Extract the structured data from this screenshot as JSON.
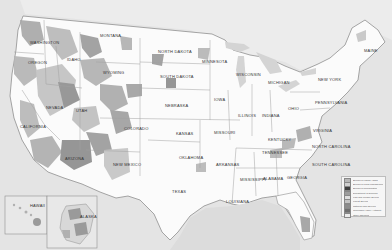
{
  "map": {
    "title": "Federal lands of the United States",
    "colors": {
      "ocean": "#e3e3e3",
      "land": "#fdfdfd",
      "federal_dark": "#8a8a8a",
      "federal_mid": "#a9a9a9",
      "federal_light": "#c9c9c9",
      "state_border": "#9a9a9a"
    },
    "state_labels": [
      {
        "name": "Washington",
        "x": 30,
        "y": 40
      },
      {
        "name": "Montana",
        "x": 100,
        "y": 33
      },
      {
        "name": "North Dakota",
        "x": 158,
        "y": 49
      },
      {
        "name": "Minnesota",
        "x": 202,
        "y": 59
      },
      {
        "name": "Oregon",
        "x": 28,
        "y": 60
      },
      {
        "name": "Idaho",
        "x": 67,
        "y": 57
      },
      {
        "name": "South Dakota",
        "x": 160,
        "y": 74
      },
      {
        "name": "Wyoming",
        "x": 103,
        "y": 70
      },
      {
        "name": "Wisconsin",
        "x": 236,
        "y": 72
      },
      {
        "name": "Michigan",
        "x": 268,
        "y": 80
      },
      {
        "name": "New York",
        "x": 318,
        "y": 77
      },
      {
        "name": "Maine",
        "x": 364,
        "y": 48
      },
      {
        "name": "Nebraska",
        "x": 165,
        "y": 103
      },
      {
        "name": "Iowa",
        "x": 214,
        "y": 97
      },
      {
        "name": "Nevada",
        "x": 46,
        "y": 105
      },
      {
        "name": "Utah",
        "x": 76,
        "y": 108
      },
      {
        "name": "Colorado",
        "x": 124,
        "y": 126
      },
      {
        "name": "Kansas",
        "x": 176,
        "y": 131
      },
      {
        "name": "Missouri",
        "x": 214,
        "y": 130
      },
      {
        "name": "Illinois",
        "x": 238,
        "y": 113
      },
      {
        "name": "Indiana",
        "x": 262,
        "y": 113
      },
      {
        "name": "Ohio",
        "x": 288,
        "y": 106
      },
      {
        "name": "Pennsylvania",
        "x": 315,
        "y": 100
      },
      {
        "name": "California",
        "x": 20,
        "y": 124
      },
      {
        "name": "Kentucky",
        "x": 268,
        "y": 137
      },
      {
        "name": "Virginia",
        "x": 313,
        "y": 128
      },
      {
        "name": "Tennessee",
        "x": 262,
        "y": 150
      },
      {
        "name": "North Carolina",
        "x": 312,
        "y": 144
      },
      {
        "name": "Arizona",
        "x": 65,
        "y": 156
      },
      {
        "name": "New Mexico",
        "x": 113,
        "y": 162
      },
      {
        "name": "Oklahoma",
        "x": 179,
        "y": 155
      },
      {
        "name": "Arkansas",
        "x": 216,
        "y": 162
      },
      {
        "name": "South Carolina",
        "x": 312,
        "y": 162
      },
      {
        "name": "Texas",
        "x": 172,
        "y": 189
      },
      {
        "name": "Mississippi",
        "x": 240,
        "y": 177
      },
      {
        "name": "Alabama",
        "x": 263,
        "y": 176
      },
      {
        "name": "Georgia",
        "x": 287,
        "y": 175
      },
      {
        "name": "Louisiana",
        "x": 226,
        "y": 199
      },
      {
        "name": "Hawaii",
        "x": 30,
        "y": 203
      },
      {
        "name": "Alaska",
        "x": 80,
        "y": 214
      }
    ],
    "legend": {
      "items": [
        {
          "label": "Bureau of Indian Affairs",
          "color": "#b7b7b7"
        },
        {
          "label": "Bureau of Land Management",
          "color": "#cfcfcf"
        },
        {
          "label": "Bureau of Reclamation",
          "color": "#3e3e3e"
        },
        {
          "label": "Department of Defense",
          "color": "#9d9d9d"
        },
        {
          "label": "Fish and Wildlife Service",
          "color": "#dedede"
        },
        {
          "label": "Forest Service",
          "color": "#c3c3c3"
        },
        {
          "label": "National Park Service",
          "color": "#8c8c8c"
        },
        {
          "label": "Tennessee Valley Authority",
          "color": "#6f6f6f"
        },
        {
          "label": "Other agencies",
          "color": "#ebebeb"
        }
      ]
    }
  }
}
